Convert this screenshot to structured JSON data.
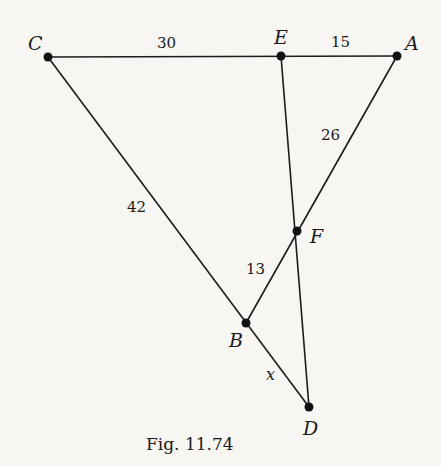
{
  "figure": {
    "caption": "Fig. 11.74",
    "points": {
      "C": {
        "label": "C",
        "x": 48,
        "y": 57
      },
      "E": {
        "label": "E",
        "x": 281,
        "y": 56
      },
      "A": {
        "label": "A",
        "x": 397,
        "y": 56
      },
      "F": {
        "label": "F",
        "x": 297,
        "y": 231
      },
      "B": {
        "label": "B",
        "x": 246,
        "y": 323
      },
      "D": {
        "label": "D",
        "x": 309,
        "y": 407
      }
    },
    "segments": [
      {
        "from": "C",
        "to": "A"
      },
      {
        "from": "C",
        "to": "D"
      },
      {
        "from": "A",
        "to": "B"
      },
      {
        "from": "E",
        "to": "D"
      }
    ],
    "lengths": {
      "CE": "30",
      "EA": "15",
      "AF": "26",
      "CB": "42",
      "FB": "13",
      "BD": "x"
    },
    "colors": {
      "line": "#1c1c1c",
      "background": "#f7f6f3"
    }
  }
}
